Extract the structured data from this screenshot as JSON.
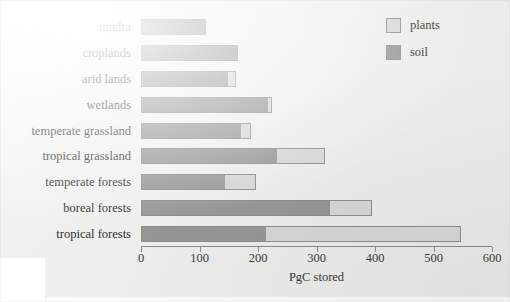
{
  "chart_data": {
    "type": "bar",
    "orientation": "horizontal",
    "stacked": true,
    "title": "",
    "xlabel": "PgC stored",
    "ylabel": "",
    "xlim": [
      0,
      600
    ],
    "xticks": [
      0,
      100,
      200,
      300,
      400,
      500,
      600
    ],
    "xtick_labels": [
      "0",
      "100",
      "200",
      "300",
      "400",
      "500",
      "600"
    ],
    "grid": false,
    "legend_position": "top-right",
    "categories": [
      "tundra",
      "croplands",
      "arid lands",
      "wetlands",
      "temperate grassland",
      "tropical grassland",
      "temperate forests",
      "boreal forests",
      "tropical forests"
    ],
    "series": [
      {
        "name": "soil",
        "color": "#969692",
        "values": [
          111,
          166,
          149,
          217,
          171,
          233,
          144,
          323,
          214
        ]
      },
      {
        "name": "plants",
        "color": "#d6d6d2",
        "values": [
          0,
          0,
          13,
          7,
          17,
          81,
          53,
          72,
          333
        ]
      }
    ],
    "totals": [
      111,
      166,
      162,
      224,
      188,
      314,
      197,
      395,
      547
    ]
  },
  "legend": {
    "items": [
      {
        "label": "plants",
        "color": "#d6d6d2"
      },
      {
        "label": "soil",
        "color": "#969692"
      }
    ]
  },
  "axis": {
    "x_label": "PgC stored"
  }
}
